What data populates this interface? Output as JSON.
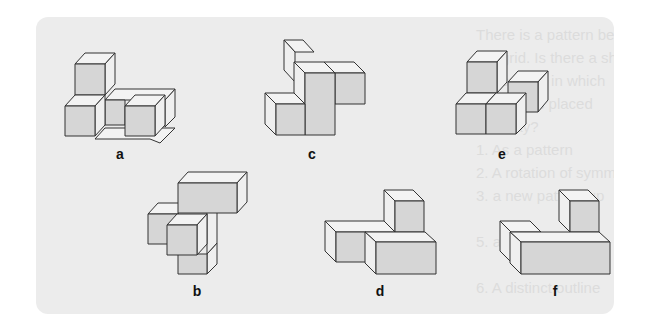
{
  "colors": {
    "background": "#ffffff",
    "panel": "#ececec",
    "front_face": "#d6d6d6",
    "side_face": "#efefef",
    "top_face": "#f3f3f3",
    "stroke": "#333333",
    "ghost_text": "#dcdcdc"
  },
  "ghost_text_lines": [
    "There is a pattern between",
    "the grid. Is there a shape in",
    "the square in which",
    "a shape is placed",
    "this way?",
    "1. As a pattern",
    "2. A rotation of symmetry",
    "3. a new pattern up",
    "",
    "5. a figure flip twice",
    "",
    "6. A distinct outline"
  ],
  "figures": [
    {
      "id": "a",
      "label": "a",
      "label_pos": [
        120,
        155
      ]
    },
    {
      "id": "c",
      "label": "c",
      "label_pos": [
        312,
        155
      ]
    },
    {
      "id": "e",
      "label": "e",
      "label_pos": [
        502,
        155
      ]
    },
    {
      "id": "b",
      "label": "b",
      "label_pos": [
        197,
        291
      ]
    },
    {
      "id": "d",
      "label": "d",
      "label_pos": [
        380,
        291
      ]
    },
    {
      "id": "f",
      "label": "f",
      "label_pos": [
        555,
        291
      ]
    }
  ]
}
